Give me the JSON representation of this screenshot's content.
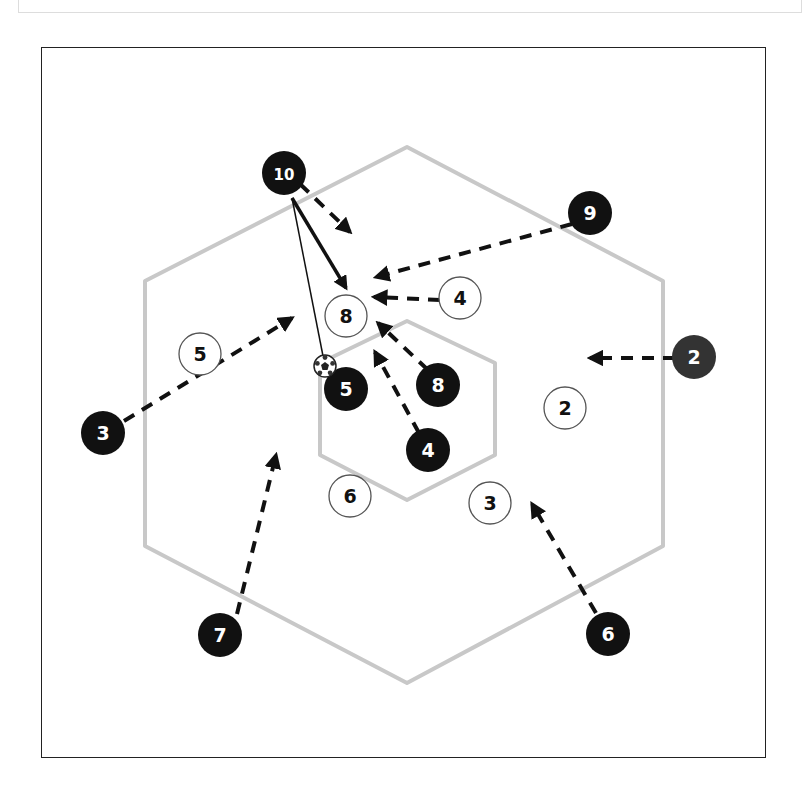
{
  "diagram": {
    "title": "",
    "colors": {
      "frame": "#222222",
      "hexagon": "#c8c8c8",
      "attacker_fill": "#111111",
      "attacker_dark_fill": "#333333",
      "defender_fill": "#ffffff",
      "defender_stroke": "#555555",
      "arrow": "#111111"
    },
    "attackers": [
      {
        "id": "a10",
        "label": "10",
        "x": 284,
        "y": 173
      },
      {
        "id": "a9",
        "label": "9",
        "x": 590,
        "y": 213
      },
      {
        "id": "a2",
        "label": "2",
        "x": 694,
        "y": 357
      },
      {
        "id": "a3",
        "label": "3",
        "x": 103,
        "y": 433
      },
      {
        "id": "a5",
        "label": "5",
        "x": 346,
        "y": 389
      },
      {
        "id": "a8",
        "label": "8",
        "x": 438,
        "y": 385
      },
      {
        "id": "a4",
        "label": "4",
        "x": 428,
        "y": 450
      },
      {
        "id": "a7",
        "label": "7",
        "x": 220,
        "y": 635
      },
      {
        "id": "a6",
        "label": "6",
        "x": 608,
        "y": 634
      }
    ],
    "defenders": [
      {
        "id": "d8",
        "label": "8",
        "x": 346,
        "y": 316
      },
      {
        "id": "d4",
        "label": "4",
        "x": 460,
        "y": 298
      },
      {
        "id": "d5",
        "label": "5",
        "x": 200,
        "y": 354
      },
      {
        "id": "d2",
        "label": "2",
        "x": 565,
        "y": 408
      },
      {
        "id": "d6",
        "label": "6",
        "x": 350,
        "y": 496
      },
      {
        "id": "d3",
        "label": "3",
        "x": 490,
        "y": 503
      }
    ],
    "ball": {
      "x": 325,
      "y": 366
    },
    "outer_hexagon": "407,147 663,281 663,546 407,683 145,546 145,281",
    "inner_hexagon": "407,321 495,363 495,455 407,500 320,455 320,363",
    "runs": [
      {
        "from": "a10",
        "x1": 300,
        "y1": 184,
        "x2": 350,
        "y2": 232
      },
      {
        "from": "a9",
        "x1": 572,
        "y1": 224,
        "x2": 376,
        "y2": 277
      },
      {
        "from": "d4",
        "x1": 440,
        "y1": 300,
        "x2": 374,
        "y2": 297
      },
      {
        "from": "a2",
        "x1": 675,
        "y1": 358,
        "x2": 590,
        "y2": 358
      },
      {
        "from": "a3",
        "x1": 124,
        "y1": 421,
        "x2": 292,
        "y2": 318
      },
      {
        "from": "a8",
        "x1": 428,
        "y1": 370,
        "x2": 378,
        "y2": 323
      },
      {
        "from": "a4",
        "x1": 419,
        "y1": 433,
        "x2": 375,
        "y2": 352
      },
      {
        "from": "a7",
        "x1": 237,
        "y1": 614,
        "x2": 276,
        "y2": 455
      },
      {
        "from": "a6",
        "x1": 596,
        "y1": 613,
        "x2": 532,
        "y2": 504
      }
    ],
    "passes": [
      {
        "from": "a10",
        "x1": 292,
        "y1": 198,
        "x2": 346,
        "y2": 288,
        "type": "pass"
      },
      {
        "from": "a10",
        "x1": 292,
        "y1": 198,
        "x2": 323,
        "y2": 356,
        "type": "ball_path"
      }
    ]
  }
}
